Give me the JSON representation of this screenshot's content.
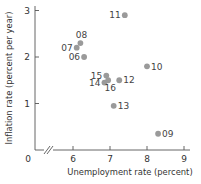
{
  "chart_data": {
    "type": "scatter",
    "title": "",
    "xlabel": "Unemployment rate (percent)",
    "ylabel": "Inflation rate (percent per year)",
    "xlim": [
      6,
      9
    ],
    "ylim": [
      0,
      3
    ],
    "x_ticks": [
      "6",
      "7",
      "8",
      "9"
    ],
    "y_ticks": [
      "1",
      "2",
      "3"
    ],
    "origin_label": "0",
    "axis_break": true,
    "grid": false,
    "legend": null,
    "point_color": "#9a9a9a",
    "points": [
      {
        "label": "06",
        "x": 6.3,
        "y": 2.0,
        "label_pos": "left"
      },
      {
        "label": "07",
        "x": 6.1,
        "y": 2.2,
        "label_pos": "left"
      },
      {
        "label": "08",
        "x": 6.2,
        "y": 2.3,
        "label_pos": "above"
      },
      {
        "label": "09",
        "x": 8.3,
        "y": 0.35,
        "label_pos": "right"
      },
      {
        "label": "10",
        "x": 8.0,
        "y": 1.8,
        "label_pos": "right"
      },
      {
        "label": "11",
        "x": 7.4,
        "y": 2.9,
        "label_pos": "left"
      },
      {
        "label": "12",
        "x": 7.25,
        "y": 1.5,
        "label_pos": "right"
      },
      {
        "label": "13",
        "x": 7.1,
        "y": 0.95,
        "label_pos": "right"
      },
      {
        "label": "14",
        "x": 6.85,
        "y": 1.45,
        "label_pos": "left"
      },
      {
        "label": "15",
        "x": 6.9,
        "y": 1.6,
        "label_pos": "left"
      },
      {
        "label": "16",
        "x": 6.95,
        "y": 1.5,
        "label_pos": "below"
      }
    ]
  }
}
